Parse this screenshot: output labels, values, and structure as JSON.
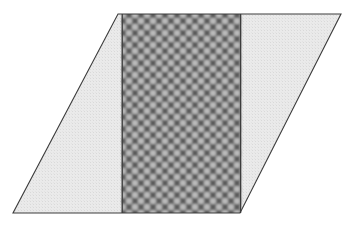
{
  "canvas": {
    "width": 354,
    "height": 226,
    "background_color": "#ffffff",
    "title": "Parallelogram with shaded vertical band"
  },
  "figure": {
    "name": "parallelogram-with-textured-band",
    "type": "geometric-diagram",
    "outline": {
      "name": "parallelogram-outline",
      "stroke_color": "#3c3c3c",
      "stroke_width": 1.1,
      "fill_color": "#e9e9e9",
      "vertices": [
        {
          "label": "top-left",
          "x": 118,
          "y": 14
        },
        {
          "label": "top-right",
          "x": 341,
          "y": 14
        },
        {
          "label": "bottom-right",
          "x": 240,
          "y": 213
        },
        {
          "label": "bottom-left",
          "x": 13,
          "y": 213
        }
      ],
      "top_edge_y": 14,
      "bottom_edge_y": 213,
      "horizontal_shear_px": 105,
      "height_px": 199,
      "base_length_px": 223
    },
    "band": {
      "name": "shaded-vertical-band",
      "left_x": 122,
      "right_x": 241,
      "top_y": 14,
      "bottom_y": 213,
      "width_px": 119,
      "height_px": 199,
      "base_fill_color": "#8a8a8a",
      "stroke_color": "#3c3c3c",
      "stroke_width": 1.2,
      "texture": {
        "kind": "halftone-checkerboard-dots",
        "period_px": 12,
        "light_dot_color": "#c8c8c8",
        "dark_dot_color": "#5a5a5a",
        "description": "alternating light round blobs and dark cross blobs on a 12px diagonal lattice"
      }
    },
    "light_regions": [
      {
        "name": "left-light-triangle",
        "fill_color": "#e9e9e9",
        "vertices": [
          {
            "x": 118,
            "y": 14
          },
          {
            "x": 122,
            "y": 14
          },
          {
            "x": 122,
            "y": 213
          },
          {
            "x": 13,
            "y": 213
          }
        ]
      },
      {
        "name": "right-light-triangle",
        "fill_color": "#e9e9e9",
        "vertices": [
          {
            "x": 241,
            "y": 14
          },
          {
            "x": 341,
            "y": 14
          },
          {
            "x": 240,
            "y": 213
          },
          {
            "x": 241,
            "y": 213
          }
        ]
      }
    ]
  }
}
